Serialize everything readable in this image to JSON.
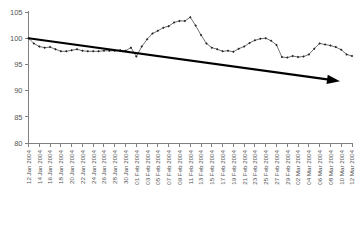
{
  "chart_data": {
    "type": "line",
    "title": "",
    "subtitle": "",
    "xlabel": "",
    "ylabel": "",
    "ylim": [
      80,
      105
    ],
    "yticks": [
      80,
      85,
      90,
      95,
      100,
      105
    ],
    "grid": false,
    "legend": null,
    "marker": "filled-diamond",
    "line_color": "#333333",
    "annotation_color": "#000000",
    "axis_color": "#808080",
    "xtick_step_days": 2,
    "xlim_labels": [
      "12 Jan 2004",
      "12 Mar 2004"
    ],
    "categories": [
      "12 Jan 2004",
      "13 Jan 2004",
      "14 Jan 2004",
      "15 Jan 2004",
      "16 Jan 2004",
      "17 Jan 2004",
      "18 Jan 2004",
      "19 Jan 2004",
      "20 Jan 2004",
      "21 Jan 2004",
      "22 Jan 2004",
      "23 Jan 2004",
      "24 Jan 2004",
      "25 Jan 2004",
      "26 Jan 2004",
      "27 Jan 2004",
      "28 Jan 2004",
      "29 Jan 2004",
      "30 Jan 2004",
      "31 Jan 2004",
      "01 Feb 2004",
      "02 Feb 2004",
      "03 Feb 2004",
      "04 Feb 2004",
      "05 Feb 2004",
      "06 Feb 2004",
      "07 Feb 2004",
      "08 Feb 2004",
      "09 Feb 2004",
      "10 Feb 2004",
      "11 Feb 2004",
      "12 Feb 2004",
      "13 Feb 2004",
      "14 Feb 2004",
      "15 Feb 2004",
      "16 Feb 2004",
      "17 Feb 2004",
      "18 Feb 2004",
      "19 Feb 2004",
      "20 Feb 2004",
      "21 Feb 2004",
      "22 Feb 2004",
      "23 Feb 2004",
      "24 Feb 2004",
      "25 Feb 2004",
      "26 Feb 2004",
      "27 Feb 2004",
      "28 Feb 2004",
      "29 Feb 2004",
      "01 Mar 2004",
      "02 Mar 2004",
      "03 Mar 2004",
      "04 Mar 2004",
      "05 Mar 2004",
      "06 Mar 2004",
      "07 Mar 2004",
      "08 Mar 2004",
      "09 Mar 2004",
      "10 Mar 2004",
      "11 Mar 2004",
      "12 Mar 2004"
    ],
    "xtick_labels": [
      "12 Jan 2004",
      "14 Jan 2004",
      "16 Jan 2004",
      "18 Jan 2004",
      "20 Jan 2004",
      "22 Jan 2004",
      "24 Jan 2004",
      "26 Jan 2004",
      "28 Jan 2004",
      "30 Jan 2004",
      "01 Feb 2004",
      "03 Feb 2004",
      "05 Feb 2004",
      "07 Feb 2004",
      "09 Feb 2004",
      "11 Feb 2004",
      "13 Feb 2004",
      "15 Feb 2004",
      "17 Feb 2004",
      "19 Feb 2004",
      "21 Feb 2004",
      "23 Feb 2004",
      "25 Feb 2004",
      "27 Feb 2004",
      "29 Feb 2004",
      "02 Mar 2004",
      "04 Mar 2004",
      "06 Mar 2004",
      "08 Mar 2004",
      "10 Mar 2004",
      "12 Mar 2004"
    ],
    "series": [
      {
        "name": "index",
        "values": [
          100.0,
          99.0,
          98.4,
          98.2,
          98.3,
          97.9,
          97.5,
          97.5,
          97.7,
          97.9,
          97.6,
          97.5,
          97.5,
          97.5,
          97.6,
          97.6,
          97.6,
          97.7,
          97.6,
          98.2,
          96.5,
          98.4,
          99.8,
          100.9,
          101.4,
          102.0,
          102.3,
          103.0,
          103.3,
          103.3,
          104.0,
          102.4,
          100.6,
          99.0,
          98.2,
          97.9,
          97.5,
          97.6,
          97.4,
          98.0,
          98.4,
          99.1,
          99.6,
          99.9,
          100.0,
          99.5,
          98.7,
          96.4,
          96.3,
          96.6,
          96.4,
          96.5,
          96.9,
          98.0,
          99.0,
          98.8,
          98.6,
          98.3,
          97.8,
          96.9,
          96.6
        ]
      }
    ],
    "annotations": [
      {
        "type": "arrow",
        "label": "downward trend arrow",
        "from": [
          "12 Jan 2004",
          100.0
        ],
        "to": [
          "12 Mar 2004",
          91.8
        ]
      }
    ]
  }
}
